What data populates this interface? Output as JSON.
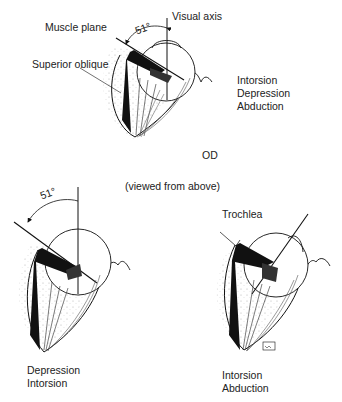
{
  "figure": {
    "top": {
      "labels": {
        "muscle_plane": "Muscle plane",
        "superior_oblique": "Superior oblique",
        "visual_axis": "Visual axis",
        "angle": "51°",
        "eye": "OD"
      },
      "actions": [
        "Intorsion",
        "Depression",
        "Abduction"
      ]
    },
    "caption": "(viewed from above)",
    "bottom_left": {
      "angle": "51°",
      "actions": [
        "Depression",
        "Intorsion"
      ]
    },
    "bottom_right": {
      "labels": {
        "trochlea": "Trochlea"
      },
      "actions": [
        "Intorsion",
        "Abduction"
      ]
    }
  }
}
